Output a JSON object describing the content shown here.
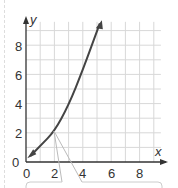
{
  "chart_data": {
    "type": "line",
    "title": "",
    "xlabel": "x",
    "ylabel": "y",
    "xlim": [
      0,
      9.5
    ],
    "ylim": [
      0,
      9.8
    ],
    "x_ticks": [
      "0",
      "2",
      "4",
      "6",
      "8"
    ],
    "y_ticks": [
      "0",
      "2",
      "4",
      "6",
      "8"
    ],
    "grid": true,
    "series": [
      {
        "name": "curve",
        "x": [
          0.3,
          1,
          2,
          3,
          4,
          5.2
        ],
        "y": [
          0.4,
          1.1,
          2.1,
          3.9,
          6.3,
          9.5
        ]
      }
    ],
    "annotations": [
      {
        "type": "callout",
        "points_to": [
          2,
          2.1
        ]
      }
    ]
  },
  "axis": {
    "x_label": "x",
    "y_label": "y",
    "x_ticks": [
      "0",
      "2",
      "4",
      "6",
      "8"
    ],
    "y_ticks": [
      "0",
      "2",
      "4",
      "6",
      "8"
    ]
  }
}
